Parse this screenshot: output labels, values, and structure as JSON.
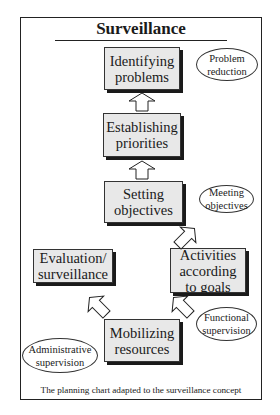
{
  "diagram": {
    "title": "Surveillance",
    "caption": "The planning chart adapted to the surveillance concept",
    "boxes": {
      "identifying": {
        "line1": "Identifying",
        "line2": "problems"
      },
      "establishing": {
        "line1": "Establishing",
        "line2": "priorities"
      },
      "setting": {
        "line1": "Setting",
        "line2": "objectives"
      },
      "evaluation": {
        "line1": "Evaluation/",
        "line2": "surveillance"
      },
      "activities": {
        "line1": "Activities",
        "line2": "according",
        "line3": "to goals"
      },
      "mobilizing": {
        "line1": "Mobilizing",
        "line2": "resources"
      }
    },
    "ellipses": {
      "problem_reduction": {
        "line1": "Problem",
        "line2": "reduction"
      },
      "meeting_objectives": {
        "line1": "Meeting",
        "line2": "objectives"
      },
      "functional_supervision": {
        "line1": "Functional",
        "line2": "supervision"
      },
      "administrative_supervision": {
        "line1": "Administrative",
        "line2": "supervision"
      }
    },
    "arrows": [
      {
        "from": "Establishing priorities",
        "to": "Identifying problems",
        "direction": "up"
      },
      {
        "from": "Setting objectives",
        "to": "Establishing priorities",
        "direction": "up"
      },
      {
        "from": "Activities according to goals",
        "to": "Setting objectives",
        "direction": "up-left"
      },
      {
        "from": "Mobilizing resources",
        "to": "Activities according to goals",
        "direction": "up-right"
      },
      {
        "from": "Mobilizing resources",
        "to": "Evaluation/surveillance",
        "direction": "up-left"
      }
    ],
    "colors": {
      "box_fill": "#e8e8e8",
      "shadow": "#1a1a1a",
      "stroke": "#333333"
    }
  }
}
